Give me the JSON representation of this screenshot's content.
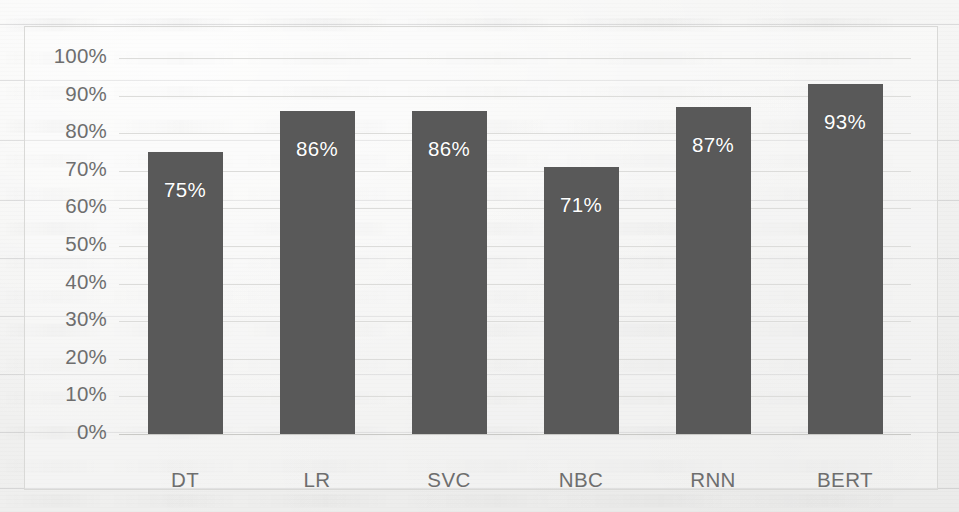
{
  "chart_data": {
    "type": "bar",
    "title": "",
    "xlabel": "",
    "ylabel": "",
    "categories": [
      "DT",
      "LR",
      "SVC",
      "NBC",
      "RNN",
      "BERT"
    ],
    "values": [
      75,
      86,
      86,
      71,
      87,
      93
    ],
    "data_labels": [
      "75%",
      "86%",
      "86%",
      "71%",
      "87%",
      "93%"
    ],
    "ylim": [
      0,
      100
    ],
    "ytick_labels": [
      "100%",
      "90%",
      "80%",
      "70%",
      "60%",
      "50%",
      "40%",
      "30%",
      "20%",
      "10%",
      "0%"
    ],
    "ytick_values": [
      100,
      90,
      80,
      70,
      60,
      50,
      40,
      30,
      20,
      10,
      0
    ],
    "grid": "horizontal",
    "legend": "none",
    "series": [
      {
        "name": "Accuracy",
        "values": [
          75,
          86,
          86,
          71,
          87,
          93
        ]
      }
    ],
    "colors": {
      "bar": "#595959",
      "data_label": "#ffffff",
      "tick_label": "#6e6e6e",
      "gridline": "#dcdcda",
      "axis": "#c9c9c6",
      "frame_border": "#d9d9d7",
      "page_background": "#f2f2f1"
    }
  }
}
